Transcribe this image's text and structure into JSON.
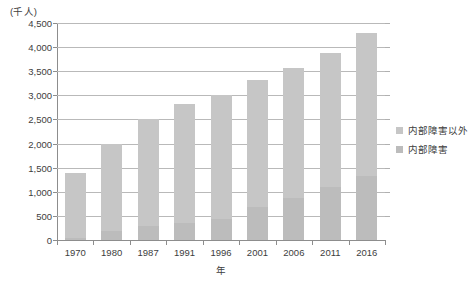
{
  "chart_data": {
    "type": "bar",
    "stacked": true,
    "title": "",
    "subtitle": "",
    "xlabel": "年",
    "ylabel": "",
    "unit_label": "(千人)",
    "categories": [
      "1970",
      "1980",
      "1987",
      "1991",
      "1996",
      "2001",
      "2006",
      "2011",
      "2016"
    ],
    "ylim": [
      0,
      4500
    ],
    "yticks": [
      "0",
      "500",
      "1,000",
      "1,500",
      "2,000",
      "2,500",
      "3,000",
      "3,500",
      "4,000",
      "4,500"
    ],
    "ytick_values": [
      0,
      500,
      1000,
      1500,
      2000,
      2500,
      3000,
      3500,
      4000,
      4500
    ],
    "grid": true,
    "legend_position": "right",
    "series": [
      {
        "name": "内部障害以外",
        "color": "#c6c6c6",
        "values": [
          1350,
          1810,
          2210,
          2470,
          2570,
          2640,
          2690,
          2770,
          2980
        ]
      },
      {
        "name": "内部障害",
        "color": "#bcbcbc",
        "values": [
          50,
          190,
          290,
          350,
          440,
          680,
          880,
          1100,
          1320
        ]
      }
    ],
    "totals": [
      1400,
      2000,
      2500,
      2820,
      3010,
      3320,
      3570,
      3870,
      4300
    ]
  },
  "legend": {
    "items": [
      {
        "label": "内部障害以外",
        "color": "#c6c6c6"
      },
      {
        "label": "内部障害",
        "color": "#bcbcbc"
      }
    ]
  }
}
